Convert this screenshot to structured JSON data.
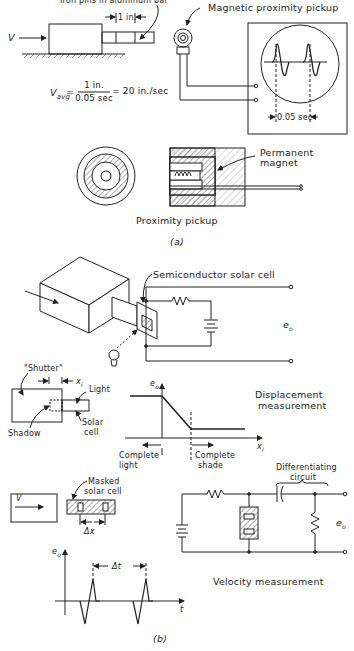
{
  "part_a": {
    "caption": "(a)",
    "label_iron_pins": "Iron pins in aluminum bar",
    "label_v": "V",
    "dim_1in": "1 in.",
    "formula": {
      "lhs": "V",
      "lhs_sub": "avg",
      "numerator": "1 in.",
      "denominator": "0.05 sec",
      "result": "= 20 in./sec"
    },
    "label_mag_pickup": "Magnetic proximity pickup",
    "scope_dim": "0.05 sec",
    "label_perm_magnet_1": "Permanent",
    "label_perm_magnet_2": "magnet",
    "label_proximity_pickup": "Proximity pickup"
  },
  "part_b": {
    "caption": "(b)",
    "label_solar_cell": "Semiconductor solar cell",
    "label_eo_1": "e",
    "label_eo_sub": "o",
    "label_shutter": "\"Shutter\"",
    "label_xi": "x",
    "label_xi_sub": "i",
    "label_light": "Light",
    "label_solar": "Solar",
    "label_cell": "cell",
    "label_shadow": "Shadow",
    "label_disp_1": "Displacement",
    "label_disp_2": "measurement",
    "label_complete_light_1": "Complete",
    "label_complete_light_2": "light",
    "label_complete_shade_1": "Complete",
    "label_complete_shade_2": "shade",
    "label_diff_1": "Differentiating",
    "label_diff_2": "circuit",
    "label_v": "V",
    "label_masked_1": "Masked",
    "label_masked_2": "solar cell",
    "label_dx": "Δx",
    "label_dt": "Δt",
    "label_t": "t",
    "label_velocity": "Velocity measurement"
  }
}
